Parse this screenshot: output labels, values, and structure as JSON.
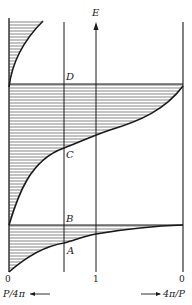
{
  "figure": {
    "axis_label_energy": "E",
    "point_labels": {
      "A": "A",
      "B": "B",
      "C": "C",
      "D": "D"
    },
    "bottom_ticks": {
      "left": "0",
      "middle": "1",
      "right": "0"
    },
    "bottom_axis_left_label": "P/4π",
    "bottom_axis_right_label": "4π/P",
    "colors": {
      "ink": "#1a1a1a",
      "hatch": "#555555",
      "background": "#ffffff"
    }
  }
}
